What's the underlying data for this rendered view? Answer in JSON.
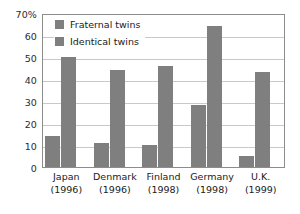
{
  "chart_data": {
    "type": "bar",
    "title": "",
    "subtitle": "",
    "xlabel": "",
    "ylabel": "",
    "categories": [
      "Japan",
      "Denmark",
      "Finland",
      "Germany",
      "U.K."
    ],
    "category_years": [
      "(1996)",
      "(1996)",
      "(1998)",
      "(1998)",
      "(1999)"
    ],
    "series": [
      {
        "name": "Fraternal twins",
        "values": [
          14,
          11,
          10,
          28,
          5
        ],
        "color": "#7f7f7f"
      },
      {
        "name": "Identical twins",
        "values": [
          50,
          44,
          46,
          64,
          43
        ],
        "color": "#7f7f7f"
      }
    ],
    "ylim": [
      0,
      70
    ],
    "y_ticks": [
      0,
      10,
      20,
      30,
      40,
      50,
      60,
      70
    ],
    "y_tick_labels": [
      "0",
      "10",
      "20",
      "30",
      "40",
      "50",
      "60",
      "70%"
    ],
    "grid": true,
    "grid_axis": "y",
    "legend_position": "top-left-inside",
    "units": "percent"
  },
  "legend": {
    "items": [
      {
        "label": "Fraternal twins"
      },
      {
        "label": "Identical twins"
      }
    ]
  },
  "colors": {
    "bar": "#7f7f7f",
    "grid": "#c9c9c9",
    "frame": "#8c8c8c",
    "text": "#1a1a1a",
    "background": "#ffffff"
  }
}
